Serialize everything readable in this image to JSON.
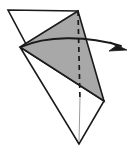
{
  "figure": {
    "type": "line-drawing",
    "canvas": {
      "width": 132,
      "height": 149,
      "background": "#ffffff"
    },
    "colors": {
      "paper_front": "#ffffff",
      "paper_back": "#a8a8a8",
      "outline": "#1a1a1a",
      "crease_dashed": "#1a1a1a",
      "axis_line": "#9a9a9a",
      "arrow": "#1a1a1a"
    },
    "shapes": {
      "base_triangle": {
        "label": "white base triangle",
        "fill": "#ffffff",
        "stroke": "#1a1a1a",
        "stroke_width": 1.6,
        "points": "8,10 78,11 79,144"
      },
      "lower_white_triangle": {
        "label": "white lower flap triangle",
        "fill": "#ffffff",
        "stroke": "#1a1a1a",
        "stroke_width": 1.6,
        "points": "20,47 104,101 79,144"
      },
      "folded_flap": {
        "label": "gray folded flap triangle",
        "fill": "#a8a8a8",
        "stroke": "#1a1a1a",
        "stroke_width": 1.6,
        "points": "78,11 20,47 104,101"
      }
    },
    "crease_line": {
      "label": "vertical dashed crease",
      "from": "78,11",
      "to": "80,100",
      "dash": "5,4",
      "stroke": "#1a1a1a",
      "stroke_width": 1.7
    },
    "center_line": {
      "label": "thin vertical center guide",
      "from": "80,97",
      "to": "79,142",
      "stroke": "#9a9a9a",
      "stroke_width": 1.0
    },
    "motion_arrow": {
      "label": "curved fold direction arrow",
      "direction": "left-to-right",
      "path": "M21,47 C45,36 86,35 121,46",
      "stroke": "#1a1a1a",
      "stroke_width": 1.9,
      "head_points": "127,50 110,42 116,46 109,51"
    }
  }
}
